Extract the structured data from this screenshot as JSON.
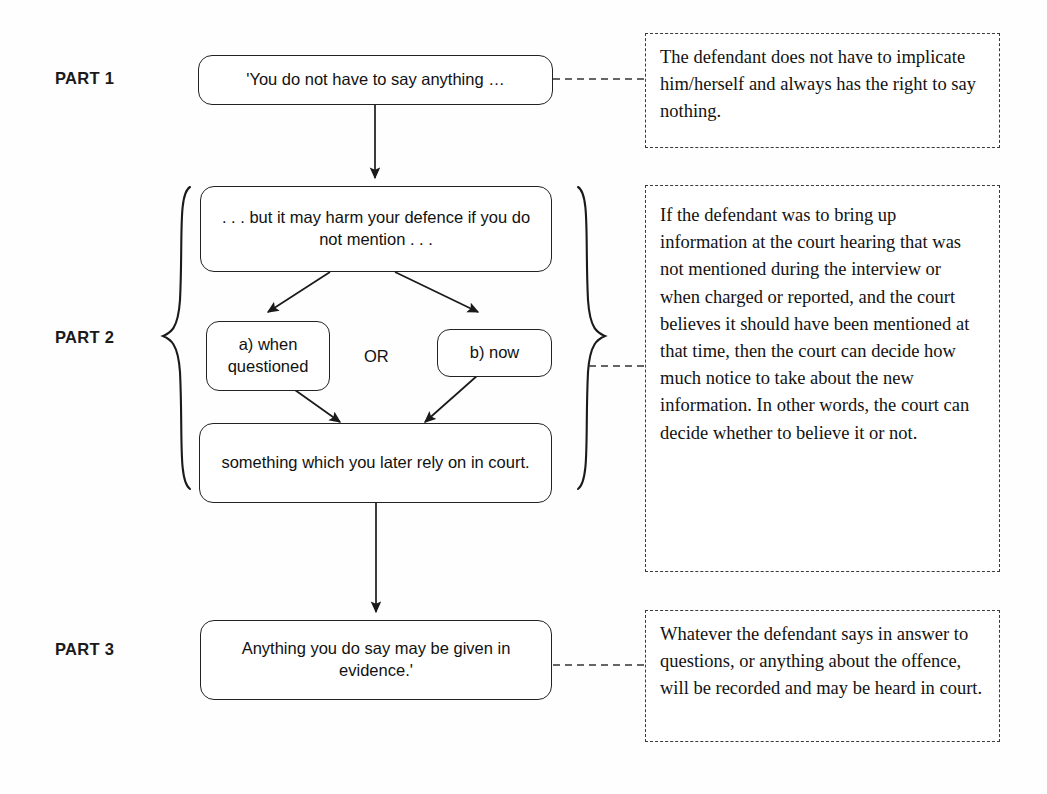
{
  "diagram": {
    "type": "flowchart",
    "colors": {
      "background": "#fefefe",
      "box_border": "#222222",
      "note_border": "#3a3a3a",
      "text": "#111111",
      "arrow": "#1a1a1a"
    }
  },
  "parts": [
    {
      "label": "PART 1"
    },
    {
      "label": "PART 2"
    },
    {
      "label": "PART 3"
    }
  ],
  "flow_boxes": {
    "part1_statement": "'You do not have to say anything …",
    "part2_statement": ". . . but it may harm your defence if you do not mention . . .",
    "option_a": "a) when questioned",
    "or": "OR",
    "option_b": "b) now",
    "part2_conclusion": "something which you later rely on in court.",
    "part3_statement": "Anything you do say may be given in evidence.'"
  },
  "notes": {
    "part1": "The defendant does not have to implicate him/herself and always has the right to say nothing.",
    "part2": "If the defendant was to bring up information at the court hearing that was not mentioned during the interview or when charged or reported, and the court believes it should have been mentioned at that time, then the court can decide how much notice to take about the new information. In other words, the court can decide whether to believe it or not.",
    "part3": "Whatever the defendant says in answer to questions, or anything about the offence, will be recorded and may be heard in court."
  }
}
